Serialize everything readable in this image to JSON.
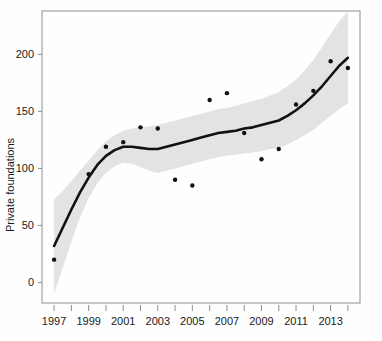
{
  "chart_data": {
    "type": "scatter",
    "title": "",
    "subtitle": "",
    "xlabel": "",
    "ylabel": "Private foundations",
    "xlim": [
      1996.3,
      2014.7
    ],
    "ylim": [
      -18,
      238
    ],
    "grid": false,
    "legend": null,
    "x": [
      1997,
      1998,
      1999,
      2000,
      2001,
      2002,
      2003,
      2004,
      2005,
      2006,
      2007,
      2008,
      2009,
      2010,
      2011,
      2012,
      2013,
      2014
    ],
    "series": [
      {
        "name": "Private foundations (observed)",
        "type": "scatter",
        "marker": "filled-circle",
        "color": "#111111",
        "values": [
          20,
          null,
          95,
          119,
          123,
          136,
          135,
          90,
          85,
          160,
          166,
          131,
          108,
          117,
          156,
          168,
          194,
          188
        ]
      },
      {
        "name": "Smoothed trend (loess fit)",
        "type": "line",
        "color": "#111111",
        "x": [
          1997,
          1997.5,
          1998,
          1998.5,
          1999,
          1999.5,
          2000,
          2000.5,
          2001,
          2001.5,
          2002,
          2002.5,
          2003,
          2003.5,
          2004,
          2004.5,
          2005,
          2005.5,
          2006,
          2006.5,
          2007,
          2007.5,
          2008,
          2008.5,
          2009,
          2009.5,
          2010,
          2010.5,
          2011,
          2011.5,
          2012,
          2012.5,
          2013,
          2013.5,
          2014
        ],
        "values": [
          32,
          48,
          64,
          79,
          92,
          103,
          111,
          116,
          119,
          119,
          118,
          117,
          117,
          119,
          121,
          123,
          125,
          127,
          129,
          131,
          132,
          133,
          135,
          136,
          138,
          140,
          142,
          146,
          151,
          157,
          164,
          172,
          181,
          190,
          197
        ]
      }
    ],
    "confidence_band": {
      "name": "95% confidence interval",
      "color": "#e3e3e3",
      "x": [
        1997,
        1997.5,
        1998,
        1998.5,
        1999,
        1999.5,
        2000,
        2000.5,
        2001,
        2001.5,
        2002,
        2002.5,
        2003,
        2003.5,
        2004,
        2004.5,
        2005,
        2005.5,
        2006,
        2006.5,
        2007,
        2007.5,
        2008,
        2008.5,
        2009,
        2009.5,
        2010,
        2010.5,
        2011,
        2011.5,
        2012,
        2012.5,
        2013,
        2013.5,
        2014
      ],
      "upper": [
        73,
        80,
        89,
        98,
        107,
        116,
        124,
        129,
        133,
        135,
        136,
        137,
        138,
        140,
        142,
        144,
        146,
        148,
        150,
        152,
        153,
        155,
        157,
        159,
        161,
        164,
        167,
        172,
        178,
        186,
        195,
        206,
        218,
        229,
        238
      ],
      "lower": [
        -10,
        13,
        36,
        57,
        74,
        87,
        96,
        102,
        105,
        104,
        101,
        98,
        96,
        98,
        100,
        102,
        104,
        106,
        108,
        110,
        111,
        112,
        113,
        114,
        115,
        117,
        118,
        121,
        125,
        129,
        134,
        140,
        146,
        152,
        157
      ]
    },
    "y_ticks": [
      0,
      50,
      100,
      150,
      200
    ],
    "y_tick_labels": [
      "0",
      "50",
      "100",
      "150",
      "200"
    ],
    "x_ticks_major": [
      1997,
      1999,
      2001,
      2003,
      2005,
      2007,
      2009,
      2011,
      2013
    ],
    "x_tick_labels": [
      "1997",
      "1999",
      "2001",
      "2003",
      "2005",
      "2007",
      "2009",
      "2011",
      "2013"
    ],
    "x_ticks_minor": [
      1998,
      2000,
      2002,
      2004,
      2006,
      2008,
      2010,
      2012,
      2014
    ]
  },
  "colors": {
    "point": "#111111",
    "line": "#111111",
    "band": "#e3e3e3",
    "frame": "#8e8e8e",
    "tick": "#8e8e8e",
    "text": "#1a1a1a",
    "background": "#fefefe"
  },
  "ylabel": "Private foundations"
}
